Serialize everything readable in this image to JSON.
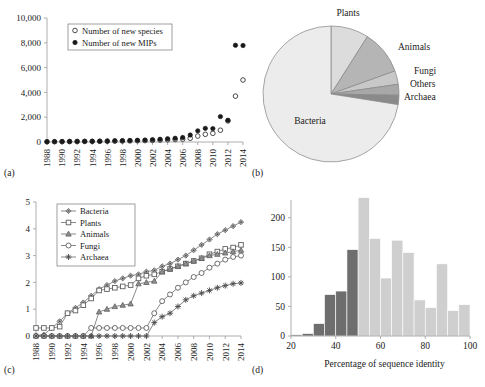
{
  "figure": {
    "panels": [
      "(a)",
      "(b)",
      "(c)",
      "(d)"
    ]
  },
  "chart_data": [
    {
      "id": "panel-a",
      "type": "scatter",
      "panel_label": "(a)",
      "title": "",
      "xlabel": "",
      "ylabel": "",
      "grid": false,
      "legend_position": "top-left",
      "xlim": [
        1988,
        2014
      ],
      "ylim": [
        0,
        10000
      ],
      "ytick_labels": [
        "0",
        "2,000",
        "4,000",
        "6,000",
        "8,000",
        "10,000"
      ],
      "ytick_values": [
        0,
        2000,
        4000,
        6000,
        8000,
        10000
      ],
      "xtick_labels": [
        "1988",
        "1990",
        "1992",
        "1994",
        "1996",
        "1998",
        "2000",
        "2002",
        "2004",
        "2006",
        "2008",
        "2010",
        "2012",
        "2014"
      ],
      "xtick_values": [
        1988,
        1990,
        1992,
        1994,
        1996,
        1998,
        2000,
        2002,
        2004,
        2006,
        2008,
        2010,
        2012,
        2014
      ],
      "x": [
        1988,
        1989,
        1990,
        1991,
        1992,
        1993,
        1994,
        1995,
        1996,
        1997,
        1998,
        1999,
        2000,
        2001,
        2002,
        2003,
        2004,
        2005,
        2006,
        2007,
        2008,
        2009,
        2010,
        2011,
        2012,
        2013,
        2014
      ],
      "series": [
        {
          "name": "Number of new species",
          "marker": "open-circle",
          "values": [
            20,
            25,
            30,
            35,
            40,
            45,
            50,
            55,
            60,
            70,
            80,
            90,
            100,
            110,
            130,
            150,
            180,
            200,
            230,
            300,
            480,
            620,
            700,
            950,
            1700,
            3700,
            5000
          ]
        },
        {
          "name": "Number of new MIPs",
          "marker": "filled-circle",
          "values": [
            25,
            30,
            35,
            45,
            50,
            55,
            60,
            70,
            80,
            95,
            110,
            120,
            140,
            160,
            190,
            220,
            260,
            300,
            360,
            560,
            900,
            1100,
            1080,
            2050,
            1750,
            7800,
            7780
          ]
        }
      ]
    },
    {
      "id": "panel-b",
      "type": "pie",
      "panel_label": "(b)",
      "title": "",
      "start_angle_deg": 270,
      "direction": "clockwise",
      "labels": [
        "Plants",
        "Animals",
        "Fungi",
        "Others",
        "Archaea",
        "Bacteria"
      ],
      "values": [
        9.0,
        10.5,
        3.2,
        2.6,
        2.2,
        72.5
      ],
      "colors": [
        "#dcdcdc",
        "#b5b5b5",
        "#c8c8c8",
        "#a8a8a8",
        "#8a8a8a",
        "#ececec"
      ]
    },
    {
      "id": "panel-c",
      "type": "line",
      "panel_label": "(c)",
      "title": "",
      "xlabel": "",
      "ylabel": "",
      "grid": false,
      "legend_position": "top-left",
      "xlim": [
        1988,
        2014
      ],
      "ylim": [
        0,
        5
      ],
      "ytick_labels": [
        "0",
        "1",
        "2",
        "3",
        "4",
        "5"
      ],
      "ytick_values": [
        0,
        1,
        2,
        3,
        4,
        5
      ],
      "xtick_labels": [
        "1988",
        "1990",
        "1992",
        "1994",
        "1996",
        "1998",
        "2000",
        "2002",
        "2004",
        "2006",
        "2008",
        "2010",
        "2012",
        "2014"
      ],
      "xtick_values": [
        1988,
        1990,
        1992,
        1994,
        1996,
        1998,
        2000,
        2002,
        2004,
        2006,
        2008,
        2010,
        2012,
        2014
      ],
      "x": [
        1988,
        1989,
        1990,
        1991,
        1992,
        1993,
        1994,
        1995,
        1996,
        1997,
        1998,
        1999,
        2000,
        2001,
        2002,
        2003,
        2004,
        2005,
        2006,
        2007,
        2008,
        2009,
        2010,
        2011,
        2012,
        2013,
        2014
      ],
      "series": [
        {
          "name": "Bacteria",
          "marker": "diamond",
          "values": [
            0.02,
            0.05,
            0.3,
            0.55,
            0.85,
            1.05,
            1.25,
            1.5,
            1.75,
            1.9,
            2.05,
            2.15,
            2.25,
            2.3,
            2.4,
            2.45,
            2.6,
            2.7,
            2.85,
            3.0,
            3.2,
            3.4,
            3.6,
            3.8,
            3.95,
            4.1,
            4.25
          ]
        },
        {
          "name": "Plants",
          "marker": "square",
          "values": [
            0.3,
            0.3,
            0.3,
            0.35,
            0.85,
            0.95,
            1.15,
            1.4,
            1.7,
            1.75,
            1.8,
            1.85,
            1.9,
            2.15,
            2.25,
            2.3,
            2.4,
            2.5,
            2.6,
            2.7,
            2.8,
            2.9,
            3.05,
            3.15,
            3.25,
            3.3,
            3.4
          ]
        },
        {
          "name": "Animals",
          "marker": "triangle",
          "values": [
            0.0,
            0.0,
            0.0,
            0.0,
            0.0,
            0.0,
            0.0,
            0.0,
            0.9,
            1.0,
            1.1,
            1.15,
            1.2,
            1.95,
            2.0,
            2.05,
            2.4,
            2.5,
            2.6,
            2.7,
            2.8,
            2.9,
            3.0,
            3.05,
            3.1,
            3.15,
            3.2
          ]
        },
        {
          "name": "Fungi",
          "marker": "circle",
          "values": [
            0.0,
            0.0,
            0.0,
            0.0,
            0.0,
            0.0,
            0.0,
            0.3,
            0.3,
            0.3,
            0.3,
            0.3,
            0.3,
            0.3,
            0.3,
            0.85,
            1.3,
            1.55,
            1.8,
            2.0,
            2.2,
            2.35,
            2.55,
            2.7,
            2.85,
            2.95,
            3.0
          ]
        },
        {
          "name": "Archaea",
          "marker": "star",
          "values": [
            0.0,
            0.0,
            0.0,
            0.0,
            0.0,
            0.0,
            0.0,
            0.0,
            0.0,
            0.0,
            0.0,
            0.0,
            0.0,
            0.0,
            0.0,
            0.5,
            0.72,
            0.85,
            1.1,
            1.35,
            1.5,
            1.6,
            1.7,
            1.8,
            1.88,
            1.95,
            1.98
          ]
        }
      ]
    },
    {
      "id": "panel-d",
      "type": "bar",
      "panel_label": "(d)",
      "title": "",
      "xlabel": "Percentage of sequence identity",
      "ylabel": "",
      "grid": false,
      "xlim": [
        20,
        100
      ],
      "ylim": [
        0,
        230
      ],
      "ytick_labels": [
        "0",
        "50",
        "100",
        "150",
        "200"
      ],
      "ytick_values": [
        0,
        50,
        100,
        150,
        200
      ],
      "xtick_labels": [
        "20",
        "40",
        "60",
        "80",
        "100"
      ],
      "xtick_values": [
        20,
        40,
        60,
        80,
        100
      ],
      "bin_width": 5,
      "bin_starts": [
        20,
        25,
        30,
        35,
        40,
        45,
        50,
        55,
        60,
        65,
        70,
        75,
        80,
        85,
        90,
        95
      ],
      "categories": [
        "20-25",
        "25-30",
        "30-35",
        "35-40",
        "40-45",
        "45-50",
        "50-55",
        "55-60",
        "60-65",
        "65-70",
        "70-75",
        "75-80",
        "80-85",
        "85-90",
        "90-95",
        "95-100"
      ],
      "values": [
        2,
        4,
        21,
        70,
        76,
        146,
        234,
        165,
        98,
        162,
        141,
        61,
        48,
        122,
        43,
        53
      ],
      "bar_colors": [
        "#6e6e6e",
        "#6e6e6e",
        "#6e6e6e",
        "#6e6e6e",
        "#6e6e6e",
        "#6e6e6e",
        "#cfcfcf",
        "#cfcfcf",
        "#cfcfcf",
        "#cfcfcf",
        "#cfcfcf",
        "#cfcfcf",
        "#cfcfcf",
        "#cfcfcf",
        "#cfcfcf",
        "#cfcfcf"
      ]
    }
  ]
}
